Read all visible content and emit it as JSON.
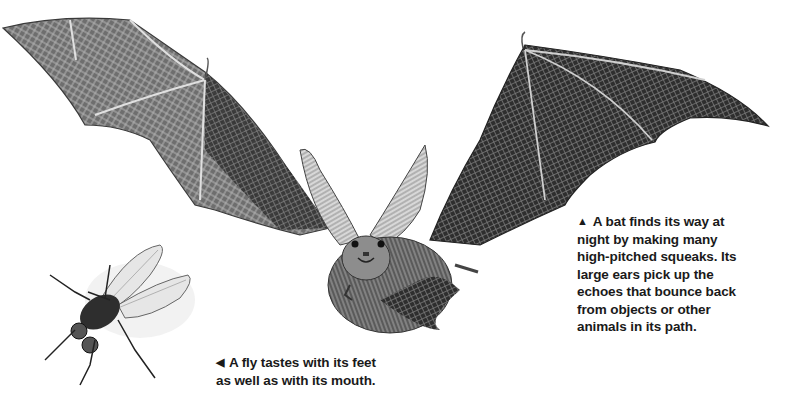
{
  "captions": {
    "bat": {
      "arrow": "▲",
      "lines": [
        "A bat finds its way at",
        "night by making many",
        "high-pitched squeaks. Its",
        "large ears pick up the",
        "echoes that bounce back",
        "from objects or other",
        "animals in its path."
      ]
    },
    "fly": {
      "arrow": "◀",
      "lines": [
        "A fly tastes with its feet",
        "as well as with its mouth."
      ]
    }
  },
  "illustrations": {
    "bat": "long-eared-bat-in-flight",
    "fly": "housefly-top-view"
  },
  "colors": {
    "background": "#ffffff",
    "ink": "#1a1a1a",
    "wing_dark": "#2a2a2a",
    "wing_light": "#8a8a8a"
  }
}
